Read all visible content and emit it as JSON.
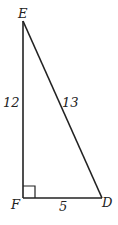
{
  "diagram": {
    "type": "right-triangle",
    "vertices": {
      "E": {
        "label": "E"
      },
      "F": {
        "label": "F"
      },
      "D": {
        "label": "D"
      }
    },
    "sides": {
      "EF": {
        "label": "12"
      },
      "ED": {
        "label": "13"
      },
      "FD": {
        "label": "5"
      }
    },
    "right_angle_at": "F",
    "colors": {
      "stroke": "#222222",
      "background": "#ffffff"
    }
  }
}
